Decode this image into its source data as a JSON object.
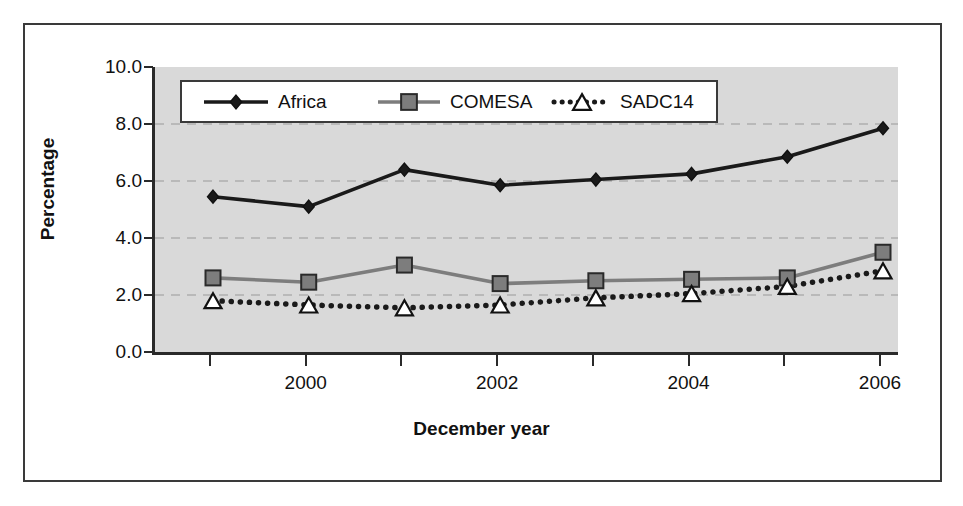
{
  "chart_data": {
    "type": "line",
    "title": "",
    "xlabel": "December year",
    "ylabel": "Percentage",
    "x": [
      1999,
      2000,
      2001,
      2002,
      2003,
      2004,
      2005,
      2006
    ],
    "xtick_labels": [
      "",
      "2000",
      "",
      "2002",
      "",
      "2004",
      "",
      "2006"
    ],
    "xlim": [
      1998.6,
      2006.4
    ],
    "ytick_labels": [
      "10.0",
      "8.0",
      "6.0",
      "4.0",
      "2.0",
      "0.0"
    ],
    "yticks": [
      10.0,
      8.0,
      6.0,
      4.0,
      2.0,
      0.0
    ],
    "ylim": [
      0.0,
      10.0
    ],
    "grid": "horizontal-dashed",
    "legend_position": "top-left-inside",
    "plot_background": "#d9d9d9",
    "series": [
      {
        "name": "Africa",
        "marker": "diamond",
        "color": "#1a1a1a",
        "line_style": "solid",
        "values": [
          5.45,
          5.1,
          6.4,
          5.85,
          6.05,
          6.25,
          6.85,
          7.85
        ]
      },
      {
        "name": "COMESA",
        "marker": "square",
        "color": "#7d7d7d",
        "line_style": "solid",
        "values": [
          2.6,
          2.45,
          3.05,
          2.4,
          2.5,
          2.55,
          2.6,
          3.5
        ]
      },
      {
        "name": "SADC14",
        "marker": "triangle",
        "color": "#1a1a1a",
        "line_style": "dotted",
        "values": [
          1.8,
          1.65,
          1.55,
          1.65,
          1.9,
          2.05,
          2.3,
          2.85
        ]
      }
    ]
  },
  "axis": {
    "y_title": "Percentage",
    "x_title": "December year"
  },
  "legend": {
    "items": [
      {
        "label": "Africa"
      },
      {
        "label": "COMESA"
      },
      {
        "label": "SADC14"
      }
    ]
  }
}
